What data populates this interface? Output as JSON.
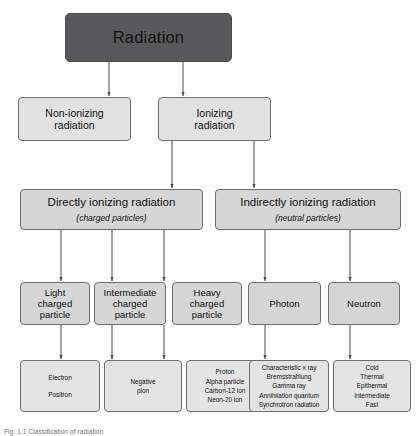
{
  "figure": {
    "caption": "Fig. 1.1 Classification of radiation",
    "colors": {
      "root_fill": "#58585a",
      "box_fill": "#d8d8d8",
      "box_fill_light": "#e4e4e4",
      "border": "#6e6e70",
      "connector": "#4d4d4d",
      "background": "#ffffff"
    }
  },
  "root": {
    "label": "Radiation"
  },
  "level2": [
    {
      "label_line1": "Non-ionizing",
      "label_line2": "radiation"
    },
    {
      "label_line1": "Ionizing",
      "label_line2": "radiation"
    }
  ],
  "level3": [
    {
      "title": "Directly ionizing radiation",
      "subtitle": "(charged particles)"
    },
    {
      "title": "Indirectly ionizing radiation",
      "subtitle": "(neutral particles)"
    }
  ],
  "level4": [
    {
      "line1": "Light",
      "line2": "charged",
      "line3": "particle"
    },
    {
      "line1": "Intermediate",
      "line2": "charged",
      "line3": "particle"
    },
    {
      "line1": "Heavy",
      "line2": "charged",
      "line3": "particle"
    },
    {
      "line1": "Photon",
      "line2": "",
      "line3": ""
    },
    {
      "line1": "Neutron",
      "line2": "",
      "line3": ""
    }
  ],
  "level5": [
    {
      "items": [
        "Electron",
        "Positron"
      ],
      "spaced": true
    },
    {
      "items": [
        "Negative",
        "pion"
      ],
      "spaced": false
    },
    {
      "items": [
        "Proton",
        "Alpha particle",
        "Carbon-12 ion",
        "Neon-20 ion"
      ],
      "spaced": false
    },
    {
      "items": [
        "Characteristic x ray",
        "Bremsstrahlung",
        "Gamma ray",
        "Annihilation quantum",
        "Synchrotron radiation"
      ],
      "spaced": false
    },
    {
      "items": [
        "Cold",
        "Thermal",
        "Epithermal",
        "Intermediate",
        "Fast"
      ],
      "spaced": false
    }
  ]
}
